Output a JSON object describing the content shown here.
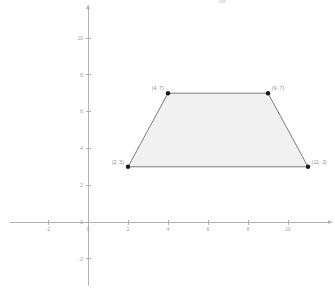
{
  "figure": {
    "kind": "coordinate-plane-polygon",
    "background_color": "#ffffff"
  },
  "chart_data": {
    "type": "scatter",
    "title": "",
    "subtitle": "",
    "xlabel": "",
    "ylabel": "",
    "xlim": [
      -3.9,
      12.2
    ],
    "ylim": [
      -3.5,
      11.8
    ],
    "grid": false,
    "legend": null,
    "x_ticks": [
      -2,
      0,
      2,
      4,
      6,
      8,
      10
    ],
    "x_tick_labels": [
      "-2",
      "0",
      "2",
      "4",
      "6",
      "8",
      "10"
    ],
    "y_ticks": [
      -2,
      0,
      2,
      4,
      6,
      8,
      10
    ],
    "y_tick_labels": [
      "-2",
      "0",
      "2",
      "4",
      "6",
      "8",
      "10"
    ],
    "shapes": [
      {
        "name": "trapezoid",
        "closed": true,
        "fill_color": "#f0f0f0",
        "edge_color": "#6e6e6e",
        "vertices": [
          {
            "x": 2,
            "y": 3,
            "label": "(2, 3)",
            "label_side": "left"
          },
          {
            "x": 4,
            "y": 7,
            "label": "(4, 7)",
            "label_side": "left"
          },
          {
            "x": 9,
            "y": 7,
            "label": "(9, 7)",
            "label_side": "right"
          },
          {
            "x": 11,
            "y": 3,
            "label": "(11, 3)",
            "label_side": "right"
          }
        ]
      }
    ],
    "axes": {
      "x_axis_color": "#b2b2b2",
      "y_axis_color": "#b2b2b2",
      "origin_label": "0"
    }
  }
}
